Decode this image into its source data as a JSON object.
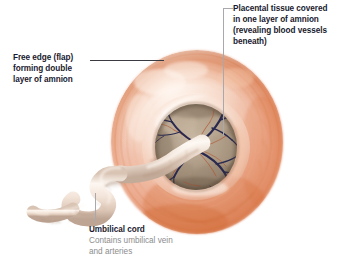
{
  "figure": {
    "background_color": "#ffffff",
    "width": 349,
    "height": 273
  },
  "labels": {
    "placental_tissue": {
      "text": "Placental tissue covered in one layer of amnion (revealing blood vessels beneath)",
      "lines": [
        "Placental tissue covered",
        "in one layer of amnion",
        "(revealing blood vessels",
        "beneath)"
      ],
      "color": "#191a2e",
      "leader_color": "#a9a9ad"
    },
    "free_edge": {
      "text": "Free edge (flap) forming double layer of amnion",
      "lines": [
        "Free edge (flap)",
        "forming double",
        "layer of amnion"
      ],
      "color": "#191a2e",
      "leader_color": "#3a3a42"
    },
    "umbilical_cord": {
      "title": "Umbilical cord",
      "subtitle_lines": [
        "Contains umbilical vein",
        "and arteries"
      ],
      "title_color": "#191a2e",
      "subtitle_color": "#8d8d8d",
      "leader_color": "#a9a9ad"
    }
  },
  "anatomy": {
    "placenta_disc": {
      "name": "placental-disc",
      "outer_color_light": "#f6ded4",
      "outer_color_mid": "#eeb79f",
      "outer_color_deep": "#d97a52",
      "edge_shadow": "#c2apr",
      "center_x": 197,
      "center_y": 142,
      "radius_x": 85,
      "radius_y": 92
    },
    "amnion_ring": {
      "name": "amnion-ring",
      "highlight_color": "#fdf0e8",
      "shade_color": "#e2a487"
    },
    "inner_cavity": {
      "name": "placental-inner-tissue",
      "tissue_color": "#a79484",
      "tissue_highlight": "#c4b39e",
      "tissue_shadow": "#6f5c4c",
      "center_x": 196,
      "center_y": 147,
      "radius_x": 41,
      "radius_y": 43
    },
    "blood_vessels": {
      "name": "blood-vessels",
      "vein_color": "#2b2b55",
      "artery_color": "#b04a2a",
      "count": 14
    },
    "umbilical_cord": {
      "name": "umbilical-cord",
      "color_light": "#fbf3ec",
      "color_mid": "#e9d9cd",
      "color_shadow": "#c7b2a3",
      "insertion_x": 196,
      "insertion_y": 146
    }
  }
}
